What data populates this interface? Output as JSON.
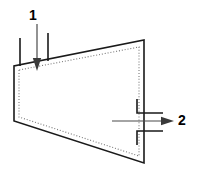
{
  "figure": {
    "type": "technical-line-diagram",
    "background_color": "#ffffff",
    "outline_color": "#1a1a1a",
    "dotted_color": "#777777",
    "arrow_color": "#3a3a3a",
    "label_color": "#000000"
  },
  "callouts": [
    {
      "id": "callout-1",
      "label": "1",
      "role": "inlet",
      "direction": "down",
      "label_x": 33,
      "label_y": 16,
      "shaft_x1": 37,
      "shaft_y1": 24,
      "shaft_x2": 37,
      "shaft_y2": 58,
      "head_tip_x": 37,
      "head_tip_y": 71,
      "head_half_width": 4.2,
      "head_length": 13
    },
    {
      "id": "callout-2",
      "label": "2",
      "role": "outlet",
      "direction": "right",
      "label_x": 182,
      "label_y": 121,
      "shaft_x1": 112,
      "shaft_y1": 121,
      "shaft_x2": 161,
      "shaft_y2": 121,
      "head_tip_x": 174,
      "head_tip_y": 121,
      "head_half_width": 4.2,
      "head_length": 13
    }
  ],
  "shape": {
    "name": "chamber-body",
    "outline_points": "14,66 14,121 144,163 144,40",
    "inner_dotted_points": "19,70 19,117 139,156 139,47"
  },
  "ports": [
    {
      "name": "inlet-port-left-wall",
      "path": "M 20,38 L 20,66"
    },
    {
      "name": "inlet-port-right-wall",
      "path": "M 48,33 L 48,61"
    },
    {
      "name": "outlet-port-upper-wall",
      "path": "M 137,99 L 137,113 L 163,113"
    },
    {
      "name": "outlet-port-lower-wall",
      "path": "M 137,145 L 137,131 L 163,131"
    }
  ]
}
